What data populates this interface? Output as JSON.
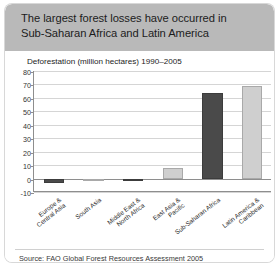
{
  "card": {
    "title_line1": "The largest forest losses have occurred in",
    "title_line2": "Sub-Saharan Africa and Latin America",
    "header_color": "#b9b9b9",
    "background_color": "#ffffff",
    "source": "Source: FAO Global Forest Resources Assessment 2005"
  },
  "chart_data": {
    "type": "bar",
    "title": "Deforestation (million hectares) 1990–2005",
    "xlabel": "",
    "ylabel": "",
    "ylim": [
      -10,
      80
    ],
    "yticks": [
      80,
      70,
      60,
      50,
      40,
      30,
      20,
      10,
      0,
      -10
    ],
    "ytick_labels": [
      "80",
      "70",
      "60",
      "50",
      "40",
      "30",
      "20",
      "10",
      "0",
      "-10"
    ],
    "grid": true,
    "legend": "none",
    "categories": [
      "Europe & Central Asia",
      "South Asia",
      "Middle East & North Africa",
      "East Asia & Pacific",
      "Sub-Saharan Africa",
      "Latin America & Caribbean"
    ],
    "category_lines": [
      [
        "Europe &",
        "Central Asia"
      ],
      [
        "South Asia",
        ""
      ],
      [
        "Middle East &",
        "North Africa"
      ],
      [
        "East Asia &",
        "Pacific"
      ],
      [
        "Sub-Saharan Africa",
        ""
      ],
      [
        "Latin America &",
        "Caribbean"
      ]
    ],
    "values": [
      -3.0,
      -0.8,
      -1.2,
      8.0,
      64.0,
      69.0
    ],
    "bar_colors": [
      "#4a4a4a",
      "#cfcfcf",
      "#4a4a4a",
      "#cfcfcf",
      "#4a4a4a",
      "#cfcfcf"
    ],
    "bar_styles": [
      "dark",
      "light",
      "dark",
      "light",
      "dark",
      "light"
    ]
  }
}
